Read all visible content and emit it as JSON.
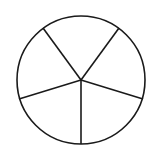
{
  "diagram": {
    "type": "divided-circle",
    "sectors": 5,
    "colors": {
      "stroke": "#1a1a1a",
      "fill": "#ffffff",
      "background": "#ffffff"
    },
    "circle": {
      "cx": 81,
      "cy": 80,
      "r": 64
    },
    "spokes": [
      {
        "x2": 43,
        "y2": 28
      },
      {
        "x2": 119,
        "y2": 28
      },
      {
        "x2": 143,
        "y2": 99
      },
      {
        "x2": 81,
        "y2": 144
      },
      {
        "x2": 19,
        "y2": 99
      }
    ]
  }
}
